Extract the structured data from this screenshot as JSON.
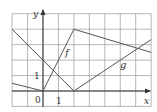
{
  "diagram": {
    "type": "function-graph",
    "axes": {
      "x_label": "x",
      "y_label": "y",
      "origin_label": "0",
      "x_tick_label": "1",
      "y_tick_label": "1"
    },
    "grid": {
      "x_min": -2,
      "x_max": 7,
      "y_min": -1,
      "y_max": 5,
      "step": 1
    },
    "functions": [
      {
        "name": "f",
        "label": "f",
        "points": [
          [
            -2,
            0.5
          ],
          [
            0,
            0
          ],
          [
            2,
            4
          ],
          [
            7,
            2.5
          ]
        ]
      },
      {
        "name": "g",
        "label": "g",
        "points": [
          [
            -2,
            4
          ],
          [
            2,
            0
          ],
          [
            7,
            3.33
          ]
        ]
      }
    ],
    "colors": {
      "grid": "#9a9a9a",
      "curve": "#555555",
      "axis": "#333333",
      "background": "#ffffff"
    }
  }
}
